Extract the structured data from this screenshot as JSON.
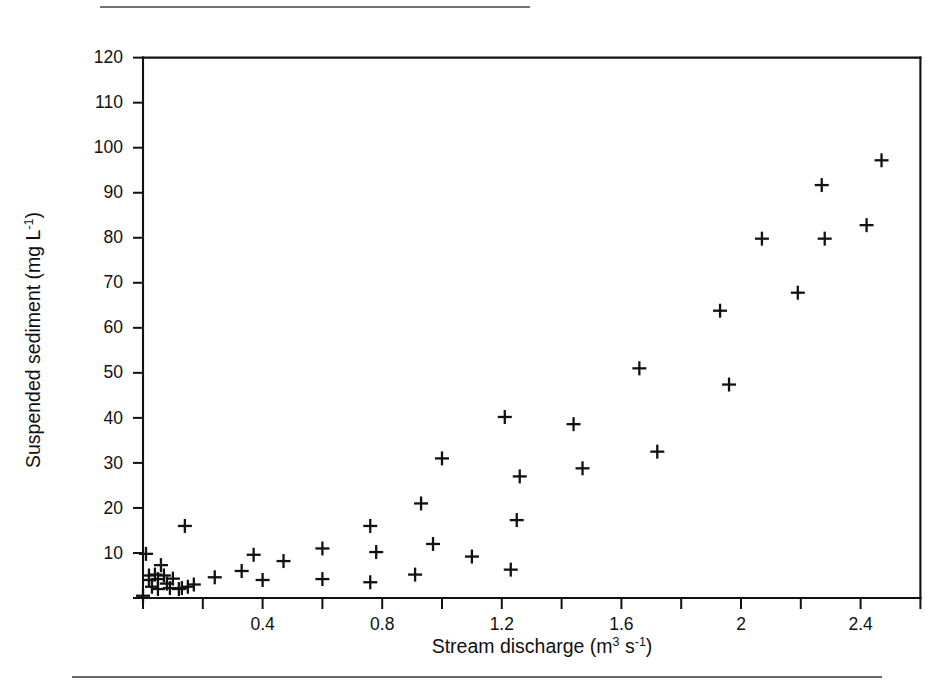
{
  "figure": {
    "axis_titles": {
      "x_main": "Stream discharge (m",
      "x_sup1": "3",
      "x_mid": " s",
      "x_sup2": "-1",
      "x_end": ")",
      "y_main": "Suspended sediment (mg  L",
      "y_sup": "-1",
      "y_end": ")"
    },
    "rules": {
      "top_rule": "top-divider",
      "bottom_rule": "bottom-divider"
    }
  },
  "chart_data": {
    "type": "scatter",
    "title": "",
    "xlabel": "Stream discharge (m3 s-1)",
    "ylabel": "Suspended sediment (mg L-1)",
    "xlim": [
      0,
      2.6
    ],
    "ylim": [
      0,
      120
    ],
    "grid": false,
    "legend": null,
    "marker": "plus",
    "marker_color": "#111111",
    "x_ticks": [
      0,
      0.2,
      0.4,
      0.6,
      0.8,
      1.0,
      1.2,
      1.4,
      1.6,
      1.8,
      2.0,
      2.2,
      2.4,
      2.6
    ],
    "x_tick_labels": [
      "",
      "",
      "0.4",
      "",
      "0.8",
      "",
      "1.2",
      "",
      "1.6",
      "",
      "2",
      "",
      "2.4",
      ""
    ],
    "y_ticks": [
      0,
      10,
      20,
      30,
      40,
      50,
      60,
      70,
      80,
      90,
      100,
      110,
      120
    ],
    "y_tick_labels": [
      "",
      "10",
      "20",
      "30",
      "40",
      "50",
      "60",
      "70",
      "80",
      "90",
      "100",
      "110",
      "120"
    ],
    "points": [
      {
        "x": 0.0,
        "y": 0.5
      },
      {
        "x": 0.01,
        "y": 9.8
      },
      {
        "x": 0.02,
        "y": 5.0
      },
      {
        "x": 0.02,
        "y": 4.0
      },
      {
        "x": 0.03,
        "y": 2.5
      },
      {
        "x": 0.04,
        "y": 5.2
      },
      {
        "x": 0.05,
        "y": 4.2
      },
      {
        "x": 0.05,
        "y": 2.0
      },
      {
        "x": 0.06,
        "y": 7.3
      },
      {
        "x": 0.07,
        "y": 5.0
      },
      {
        "x": 0.08,
        "y": 3.2
      },
      {
        "x": 0.09,
        "y": 2.2
      },
      {
        "x": 0.1,
        "y": 4.3
      },
      {
        "x": 0.12,
        "y": 2.0
      },
      {
        "x": 0.13,
        "y": 2.2
      },
      {
        "x": 0.15,
        "y": 2.5
      },
      {
        "x": 0.17,
        "y": 3.0
      },
      {
        "x": 0.14,
        "y": 16.0
      },
      {
        "x": 0.24,
        "y": 4.6
      },
      {
        "x": 0.33,
        "y": 6.0
      },
      {
        "x": 0.37,
        "y": 9.6
      },
      {
        "x": 0.4,
        "y": 4.0
      },
      {
        "x": 0.47,
        "y": 8.2
      },
      {
        "x": 0.6,
        "y": 11.0
      },
      {
        "x": 0.6,
        "y": 4.2
      },
      {
        "x": 0.76,
        "y": 16.0
      },
      {
        "x": 0.78,
        "y": 10.2
      },
      {
        "x": 0.76,
        "y": 3.5
      },
      {
        "x": 0.91,
        "y": 5.2
      },
      {
        "x": 0.93,
        "y": 21.0
      },
      {
        "x": 0.97,
        "y": 12.0
      },
      {
        "x": 1.0,
        "y": 31.0
      },
      {
        "x": 1.1,
        "y": 9.2
      },
      {
        "x": 1.21,
        "y": 40.2
      },
      {
        "x": 1.23,
        "y": 6.3
      },
      {
        "x": 1.26,
        "y": 27.0
      },
      {
        "x": 1.25,
        "y": 17.3
      },
      {
        "x": 1.44,
        "y": 38.6
      },
      {
        "x": 1.47,
        "y": 28.8
      },
      {
        "x": 1.66,
        "y": 51.0
      },
      {
        "x": 1.72,
        "y": 32.5
      },
      {
        "x": 1.93,
        "y": 63.8
      },
      {
        "x": 1.96,
        "y": 47.4
      },
      {
        "x": 2.07,
        "y": 79.8
      },
      {
        "x": 2.19,
        "y": 67.8
      },
      {
        "x": 2.27,
        "y": 91.7
      },
      {
        "x": 2.28,
        "y": 79.8
      },
      {
        "x": 2.42,
        "y": 82.8
      },
      {
        "x": 2.47,
        "y": 97.2
      }
    ]
  }
}
